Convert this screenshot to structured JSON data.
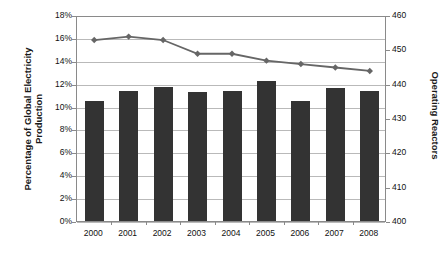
{
  "chart_data": {
    "type": "bar",
    "title": "",
    "categories": [
      "2000",
      "2001",
      "2002",
      "2003",
      "2004",
      "2005",
      "2006",
      "2007",
      "2008"
    ],
    "xlabel": "",
    "ylabel": "Percentage of Global Electricity Production",
    "ylabel_secondary": "Operating Reactors",
    "ylim": [
      0,
      0.18
    ],
    "ylim_secondary": [
      400,
      460
    ],
    "yticks": [
      "0%",
      "2%",
      "4%",
      "6%",
      "8%",
      "10%",
      "12%",
      "14%",
      "16%",
      "18%"
    ],
    "ytick_values": [
      0,
      2,
      4,
      6,
      8,
      10,
      12,
      14,
      16,
      18
    ],
    "yticks_secondary": [
      "400",
      "410",
      "420",
      "430",
      "440",
      "450",
      "460"
    ],
    "ytick_values_secondary": [
      400,
      410,
      420,
      430,
      440,
      450,
      460
    ],
    "grid": true,
    "legend": "none",
    "series": [
      {
        "name": "Percentage of Global Electricity Production",
        "type": "bar",
        "axis": "left",
        "color": "#333333",
        "values": [
          10.5,
          11.4,
          11.7,
          11.3,
          11.4,
          12.2,
          10.5,
          11.6,
          11.4
        ]
      },
      {
        "name": "Operating Reactors",
        "type": "line",
        "axis": "right",
        "color": "#666666",
        "marker": "diamond",
        "values": [
          453,
          454,
          453,
          449,
          449,
          447,
          446,
          445,
          444
        ]
      }
    ]
  },
  "axes": {
    "left_title": "Percentage of Global Electricity Production",
    "right_title": "Operating Reactors"
  }
}
